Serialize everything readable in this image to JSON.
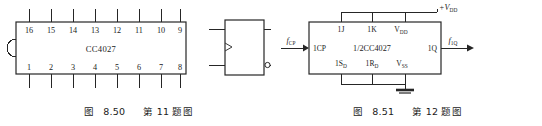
{
  "figures": [
    {
      "id": "fig-8-50",
      "caption": {
        "prefix": "图",
        "number": "8.50",
        "suffix": "第 11 题图",
        "full": "图 8.50   第 11 题图"
      },
      "package": {
        "type": "dip-16",
        "part_label": "CC4027",
        "top_pins": [
          "16",
          "15",
          "14",
          "13",
          "12",
          "11",
          "10",
          "9"
        ],
        "bottom_pins": [
          "1",
          "2",
          "3",
          "4",
          "5",
          "6",
          "7",
          "8"
        ],
        "notch": "left-semicircle"
      },
      "logic_symbol": {
        "type": "flip-flop-block",
        "clock_marker": "dynamic-input-triangle",
        "inputs": [
          "top-left",
          "bottom-left"
        ],
        "outputs": [
          "top-right",
          "bottom-right"
        ],
        "inverted_output": "bottom-right"
      }
    },
    {
      "id": "fig-8-51",
      "caption": {
        "prefix": "图",
        "number": "8.51",
        "suffix": "第 12 题图",
        "full": "图 8.51   第 12 题图"
      },
      "block": {
        "center_label": "1/2CC4027",
        "top_labels": [
          {
            "main": "1J",
            "sub": ""
          },
          {
            "main": "1K",
            "sub": ""
          },
          {
            "main": "V",
            "sub": "DD"
          }
        ],
        "bottom_labels": [
          {
            "main": "1S",
            "sub": "D"
          },
          {
            "main": "1R",
            "sub": "D"
          },
          {
            "main": "V",
            "sub": "SS"
          }
        ],
        "left_label": "1CP",
        "right_label": "1Q",
        "supply_label": {
          "main": "+V",
          "sub": "DD"
        },
        "input_signal": {
          "main": "f",
          "sub": "CP"
        },
        "output_signal": {
          "main": "f",
          "sub": "1Q"
        },
        "ground_symbol": true
      }
    }
  ],
  "colors": {
    "ink": "#262626",
    "text": "#1b1b1b",
    "paper": "#ffffff"
  }
}
